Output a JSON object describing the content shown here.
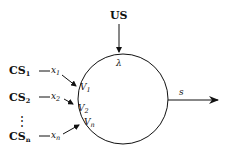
{
  "diagram": {
    "top_input": {
      "label": "US"
    },
    "neuron_param": {
      "symbol": "λ"
    },
    "output": {
      "label": "s"
    },
    "inputs": [
      {
        "cs": "CS",
        "cs_sub": "1",
        "x": "x",
        "x_sub": "1",
        "v": "V",
        "v_sub": "1"
      },
      {
        "cs": "CS",
        "cs_sub": "2",
        "x": "x",
        "x_sub": "2",
        "v": "V",
        "v_sub": "2"
      },
      {
        "cs": "CS",
        "cs_sub": "n",
        "x": "x",
        "x_sub": "n",
        "v": "V",
        "v_sub": "n"
      }
    ],
    "ellipsis": "⋮"
  }
}
